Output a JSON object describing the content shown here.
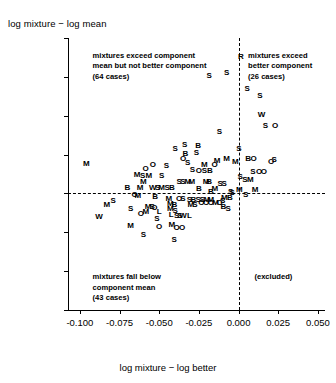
{
  "chart_data": {
    "type": "scatter",
    "title": "",
    "ylabel": "log mixture − log mean",
    "xlabel": "log mixture − log better",
    "xlim": [
      -0.1075,
      0.0545
    ],
    "ylim": [
      -0.06,
      0.08
    ],
    "xticks": [
      -0.1,
      -0.075,
      -0.05,
      -0.025,
      0.0,
      0.025,
      0.05
    ],
    "xtick_labels": [
      "-0.100",
      "-0.075",
      "-0.050",
      "-0.025",
      "0.000",
      "0.025",
      "0.050"
    ],
    "yticks": [
      0.08,
      0.06,
      0.04,
      0.02,
      0.0,
      -0.02,
      -0.04,
      -0.06
    ],
    "ytick_labels": [
      "0.08",
      "0.06",
      "0.04",
      "0.02",
      "0.00",
      "-0.02",
      "-0.04",
      "-0.06"
    ],
    "grid": false,
    "legend": "none",
    "reference_lines": [
      {
        "axis": "x",
        "value": 0.0,
        "style": "dashed"
      },
      {
        "axis": "y",
        "value": 0.0,
        "style": "dashed"
      }
    ],
    "marker_style": "letter-labels",
    "annotations": [
      {
        "name": "upper-left-note",
        "x": -0.092,
        "y": 0.0735,
        "lines": [
          "mixtures exceed component",
          "mean but not better component",
          "(64 cases)"
        ]
      },
      {
        "name": "upper-right-note",
        "x": 0.006,
        "y": 0.0735,
        "lines": [
          "mixtures exceed",
          "better component",
          "(26 cases)"
        ]
      },
      {
        "name": "lower-left-note",
        "x": -0.092,
        "y": -0.0405,
        "lines": [
          "mixtures fall below",
          "component mean",
          "(43 cases)"
        ]
      },
      {
        "name": "lower-right-note",
        "x": 0.01,
        "y": -0.0405,
        "lines": [
          "(excluded)"
        ]
      }
    ],
    "points": [
      {
        "label": "R",
        "x": 0.0015,
        "y": 0.07
      },
      {
        "label": "S",
        "x": -0.0075,
        "y": 0.0618
      },
      {
        "label": "S",
        "x": -0.0185,
        "y": 0.0606
      },
      {
        "label": "S",
        "x": 0.0055,
        "y": 0.0535
      },
      {
        "label": "S",
        "x": 0.0135,
        "y": 0.05
      },
      {
        "label": "W",
        "x": 0.0145,
        "y": 0.0405
      },
      {
        "label": "S",
        "x": 0.017,
        "y": 0.0345
      },
      {
        "label": "O",
        "x": 0.023,
        "y": 0.0345
      },
      {
        "label": "S",
        "x": -0.012,
        "y": 0.0318
      },
      {
        "label": "S",
        "x": -0.034,
        "y": 0.0248
      },
      {
        "label": "S",
        "x": -0.04,
        "y": 0.0228
      },
      {
        "label": "S",
        "x": 0.0002,
        "y": 0.0228
      },
      {
        "label": "B",
        "x": 0.006,
        "y": 0.0175
      },
      {
        "label": "O",
        "x": 0.0095,
        "y": 0.0175
      },
      {
        "label": "S",
        "x": 0.0225,
        "y": 0.017
      },
      {
        "label": "M",
        "x": -0.002,
        "y": 0.016
      },
      {
        "label": "O",
        "x": 0.0205,
        "y": 0.016
      },
      {
        "label": "B",
        "x": -0.0335,
        "y": 0.0205
      },
      {
        "label": "O",
        "x": -0.035,
        "y": 0.0175
      },
      {
        "label": "S",
        "x": -0.032,
        "y": 0.0158
      },
      {
        "label": "M",
        "x": -0.0135,
        "y": 0.0165
      },
      {
        "label": "M",
        "x": -0.0215,
        "y": 0.0145
      },
      {
        "label": "O",
        "x": -0.015,
        "y": 0.0145
      },
      {
        "label": "O",
        "x": -0.054,
        "y": 0.0145
      },
      {
        "label": "S",
        "x": -0.0455,
        "y": 0.0142
      },
      {
        "label": "O",
        "x": -0.0585,
        "y": 0.0128
      },
      {
        "label": "S",
        "x": -0.029,
        "y": 0.0122
      },
      {
        "label": "O",
        "x": -0.025,
        "y": 0.0118
      },
      {
        "label": "S",
        "x": -0.0215,
        "y": 0.0118
      },
      {
        "label": "B",
        "x": -0.018,
        "y": 0.0118
      },
      {
        "label": "S",
        "x": 0.009,
        "y": 0.0112
      },
      {
        "label": "O",
        "x": 0.013,
        "y": 0.0108
      },
      {
        "label": "O",
        "x": 0.016,
        "y": 0.0108
      },
      {
        "label": "M",
        "x": -0.064,
        "y": 0.0095
      },
      {
        "label": "S",
        "x": -0.0605,
        "y": 0.0088
      },
      {
        "label": "M",
        "x": -0.0565,
        "y": 0.0088
      },
      {
        "label": "S",
        "x": -0.0485,
        "y": 0.0088
      },
      {
        "label": "S",
        "x": 0.001,
        "y": 0.0085
      },
      {
        "label": "S",
        "x": 0.004,
        "y": 0.007
      },
      {
        "label": "M",
        "x": 0.0075,
        "y": 0.007
      },
      {
        "label": "M",
        "x": -0.06,
        "y": 0.0058
      },
      {
        "label": "S",
        "x": -0.0375,
        "y": 0.006
      },
      {
        "label": "S",
        "x": -0.035,
        "y": 0.006
      },
      {
        "label": "M",
        "x": -0.032,
        "y": 0.006
      },
      {
        "label": "M",
        "x": -0.0295,
        "y": 0.006
      },
      {
        "label": "M",
        "x": -0.0205,
        "y": 0.0058
      },
      {
        "label": "B",
        "x": -0.0185,
        "y": 0.0058
      },
      {
        "label": "S",
        "x": -0.0115,
        "y": 0.005
      },
      {
        "label": "S",
        "x": -0.009,
        "y": 0.005
      },
      {
        "label": "B",
        "x": -0.07,
        "y": 0.003
      },
      {
        "label": "M",
        "x": -0.062,
        "y": 0.003
      },
      {
        "label": "W",
        "x": -0.054,
        "y": 0.0028
      },
      {
        "label": "S",
        "x": -0.051,
        "y": 0.0028
      },
      {
        "label": "M",
        "x": -0.0485,
        "y": 0.0028
      },
      {
        "label": "S",
        "x": -0.045,
        "y": 0.0028
      },
      {
        "label": "B",
        "x": -0.042,
        "y": 0.0028
      },
      {
        "label": "B",
        "x": -0.025,
        "y": 0.0022
      },
      {
        "label": "M",
        "x": -0.015,
        "y": 0.0022
      },
      {
        "label": "B",
        "x": -0.0175,
        "y": 0.0008
      },
      {
        "label": "M",
        "x": 0.0005,
        "y": 0.0018
      },
      {
        "label": "S",
        "x": -0.004,
        "y": 0.0
      },
      {
        "label": "O",
        "x": -0.0655,
        "y": -0.001
      },
      {
        "label": "M",
        "x": -0.0635,
        "y": -0.0015
      },
      {
        "label": "B",
        "x": -0.0525,
        "y": -0.002
      },
      {
        "label": "M",
        "x": -0.044,
        "y": -0.003
      },
      {
        "label": "O",
        "x": -0.0375,
        "y": -0.003
      },
      {
        "label": "S",
        "x": -0.035,
        "y": -0.003
      },
      {
        "label": "S",
        "x": -0.031,
        "y": -0.0032
      },
      {
        "label": "B",
        "x": -0.0285,
        "y": -0.0032
      },
      {
        "label": "S",
        "x": -0.0255,
        "y": -0.0032
      },
      {
        "label": "S",
        "x": -0.023,
        "y": -0.0032
      },
      {
        "label": "M",
        "x": -0.02,
        "y": -0.0032
      },
      {
        "label": "M",
        "x": -0.0175,
        "y": -0.0032
      },
      {
        "label": "O",
        "x": -0.0235,
        "y": -0.0048
      },
      {
        "label": "O",
        "x": -0.0205,
        "y": -0.0048
      },
      {
        "label": "O",
        "x": -0.0175,
        "y": -0.0048
      },
      {
        "label": "M",
        "x": -0.0145,
        "y": -0.0048
      },
      {
        "label": "O",
        "x": -0.012,
        "y": -0.0048
      },
      {
        "label": "M",
        "x": -0.043,
        "y": -0.0055
      },
      {
        "label": "B",
        "x": -0.0405,
        "y": -0.0062
      },
      {
        "label": "M",
        "x": -0.03,
        "y": -0.0062
      },
      {
        "label": "S",
        "x": -0.0275,
        "y": -0.0062
      },
      {
        "label": "M",
        "x": -0.083,
        "y": -0.006
      },
      {
        "label": "M",
        "x": -0.057,
        "y": -0.0068
      },
      {
        "label": "S",
        "x": -0.0545,
        "y": -0.0072
      },
      {
        "label": "M",
        "x": -0.043,
        "y": -0.0082
      },
      {
        "label": "S",
        "x": -0.068,
        "y": -0.0082
      },
      {
        "label": "O",
        "x": -0.053,
        "y": -0.0075
      },
      {
        "label": "S",
        "x": -0.04,
        "y": -0.009
      },
      {
        "label": "O",
        "x": -0.0615,
        "y": -0.0105
      },
      {
        "label": "M",
        "x": -0.0585,
        "y": -0.0098
      },
      {
        "label": "L",
        "x": -0.05,
        "y": -0.0098
      },
      {
        "label": "L",
        "x": -0.0425,
        "y": -0.011
      },
      {
        "label": "S",
        "x": -0.039,
        "y": -0.0118
      },
      {
        "label": "W",
        "x": -0.035,
        "y": -0.0118
      },
      {
        "label": "S",
        "x": -0.037,
        "y": -0.0118
      },
      {
        "label": "L",
        "x": -0.031,
        "y": -0.0115
      },
      {
        "label": "S",
        "x": -0.0515,
        "y": -0.013
      },
      {
        "label": "W",
        "x": -0.088,
        "y": -0.0122
      },
      {
        "label": "M",
        "x": -0.068,
        "y": -0.0168
      },
      {
        "label": "O",
        "x": -0.05,
        "y": -0.0172
      },
      {
        "label": "M",
        "x": -0.042,
        "y": -0.0165
      },
      {
        "label": "O",
        "x": -0.039,
        "y": -0.0178
      },
      {
        "label": "O",
        "x": -0.0355,
        "y": -0.0178
      },
      {
        "label": "S",
        "x": -0.06,
        "y": -0.0212
      },
      {
        "label": "S",
        "x": -0.0405,
        "y": -0.0242
      },
      {
        "label": "M",
        "x": -0.096,
        "y": 0.0152
      },
      {
        "label": "S",
        "x": -0.079,
        "y": -0.004
      },
      {
        "label": "S",
        "x": -0.0265,
        "y": 0.021
      },
      {
        "label": "B",
        "x": -0.0255,
        "y": 0.0245
      },
      {
        "label": "M",
        "x": -0.0075,
        "y": 0.0175
      },
      {
        "label": "S",
        "x": -0.005,
        "y": 0.0008
      },
      {
        "label": "B",
        "x": -0.0055,
        "y": -0.0022
      },
      {
        "label": "M",
        "x": -0.009,
        "y": -0.0022
      },
      {
        "label": "S",
        "x": -0.01,
        "y": -0.004
      },
      {
        "label": "B",
        "x": -0.0095,
        "y": -0.007
      },
      {
        "label": "S",
        "x": -0.0065,
        "y": -0.0082
      },
      {
        "label": "M",
        "x": 0.0105,
        "y": 0.002
      },
      {
        "label": "S",
        "x": 0.0045,
        "y": -0.0008
      }
    ]
  }
}
